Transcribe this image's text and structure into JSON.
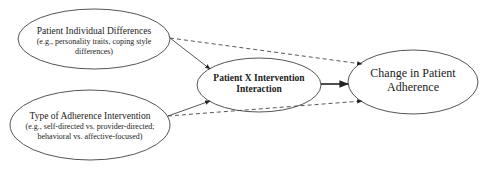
{
  "diagram": {
    "nodes": [
      {
        "id": "patient_differences",
        "title": "Patient Individual Differences",
        "subtitle_line1": "(e.g., personality traits, coping style",
        "subtitle_line2": "differences)"
      },
      {
        "id": "intervention_type",
        "title": "Type of Adherence Intervention",
        "subtitle_line1": "(e.g., self-directed vs. provider-directed;",
        "subtitle_line2": "behavioral vs. affective-focused)"
      },
      {
        "id": "interaction",
        "title_line1": "Patient X Intervention",
        "title_line2": "Interaction"
      },
      {
        "id": "outcome",
        "title_line1": "Change in Patient",
        "title_line2": "Adherence"
      }
    ],
    "edges": [
      {
        "from": "patient_differences",
        "to": "interaction",
        "style": "solid"
      },
      {
        "from": "intervention_type",
        "to": "interaction",
        "style": "solid"
      },
      {
        "from": "interaction",
        "to": "outcome",
        "style": "solid-bold"
      },
      {
        "from": "patient_differences",
        "to": "outcome",
        "style": "dashed"
      },
      {
        "from": "intervention_type",
        "to": "outcome",
        "style": "dashed"
      }
    ],
    "colors": {
      "stroke": "#444444",
      "text": "#222222",
      "background": "#ffffff"
    }
  }
}
